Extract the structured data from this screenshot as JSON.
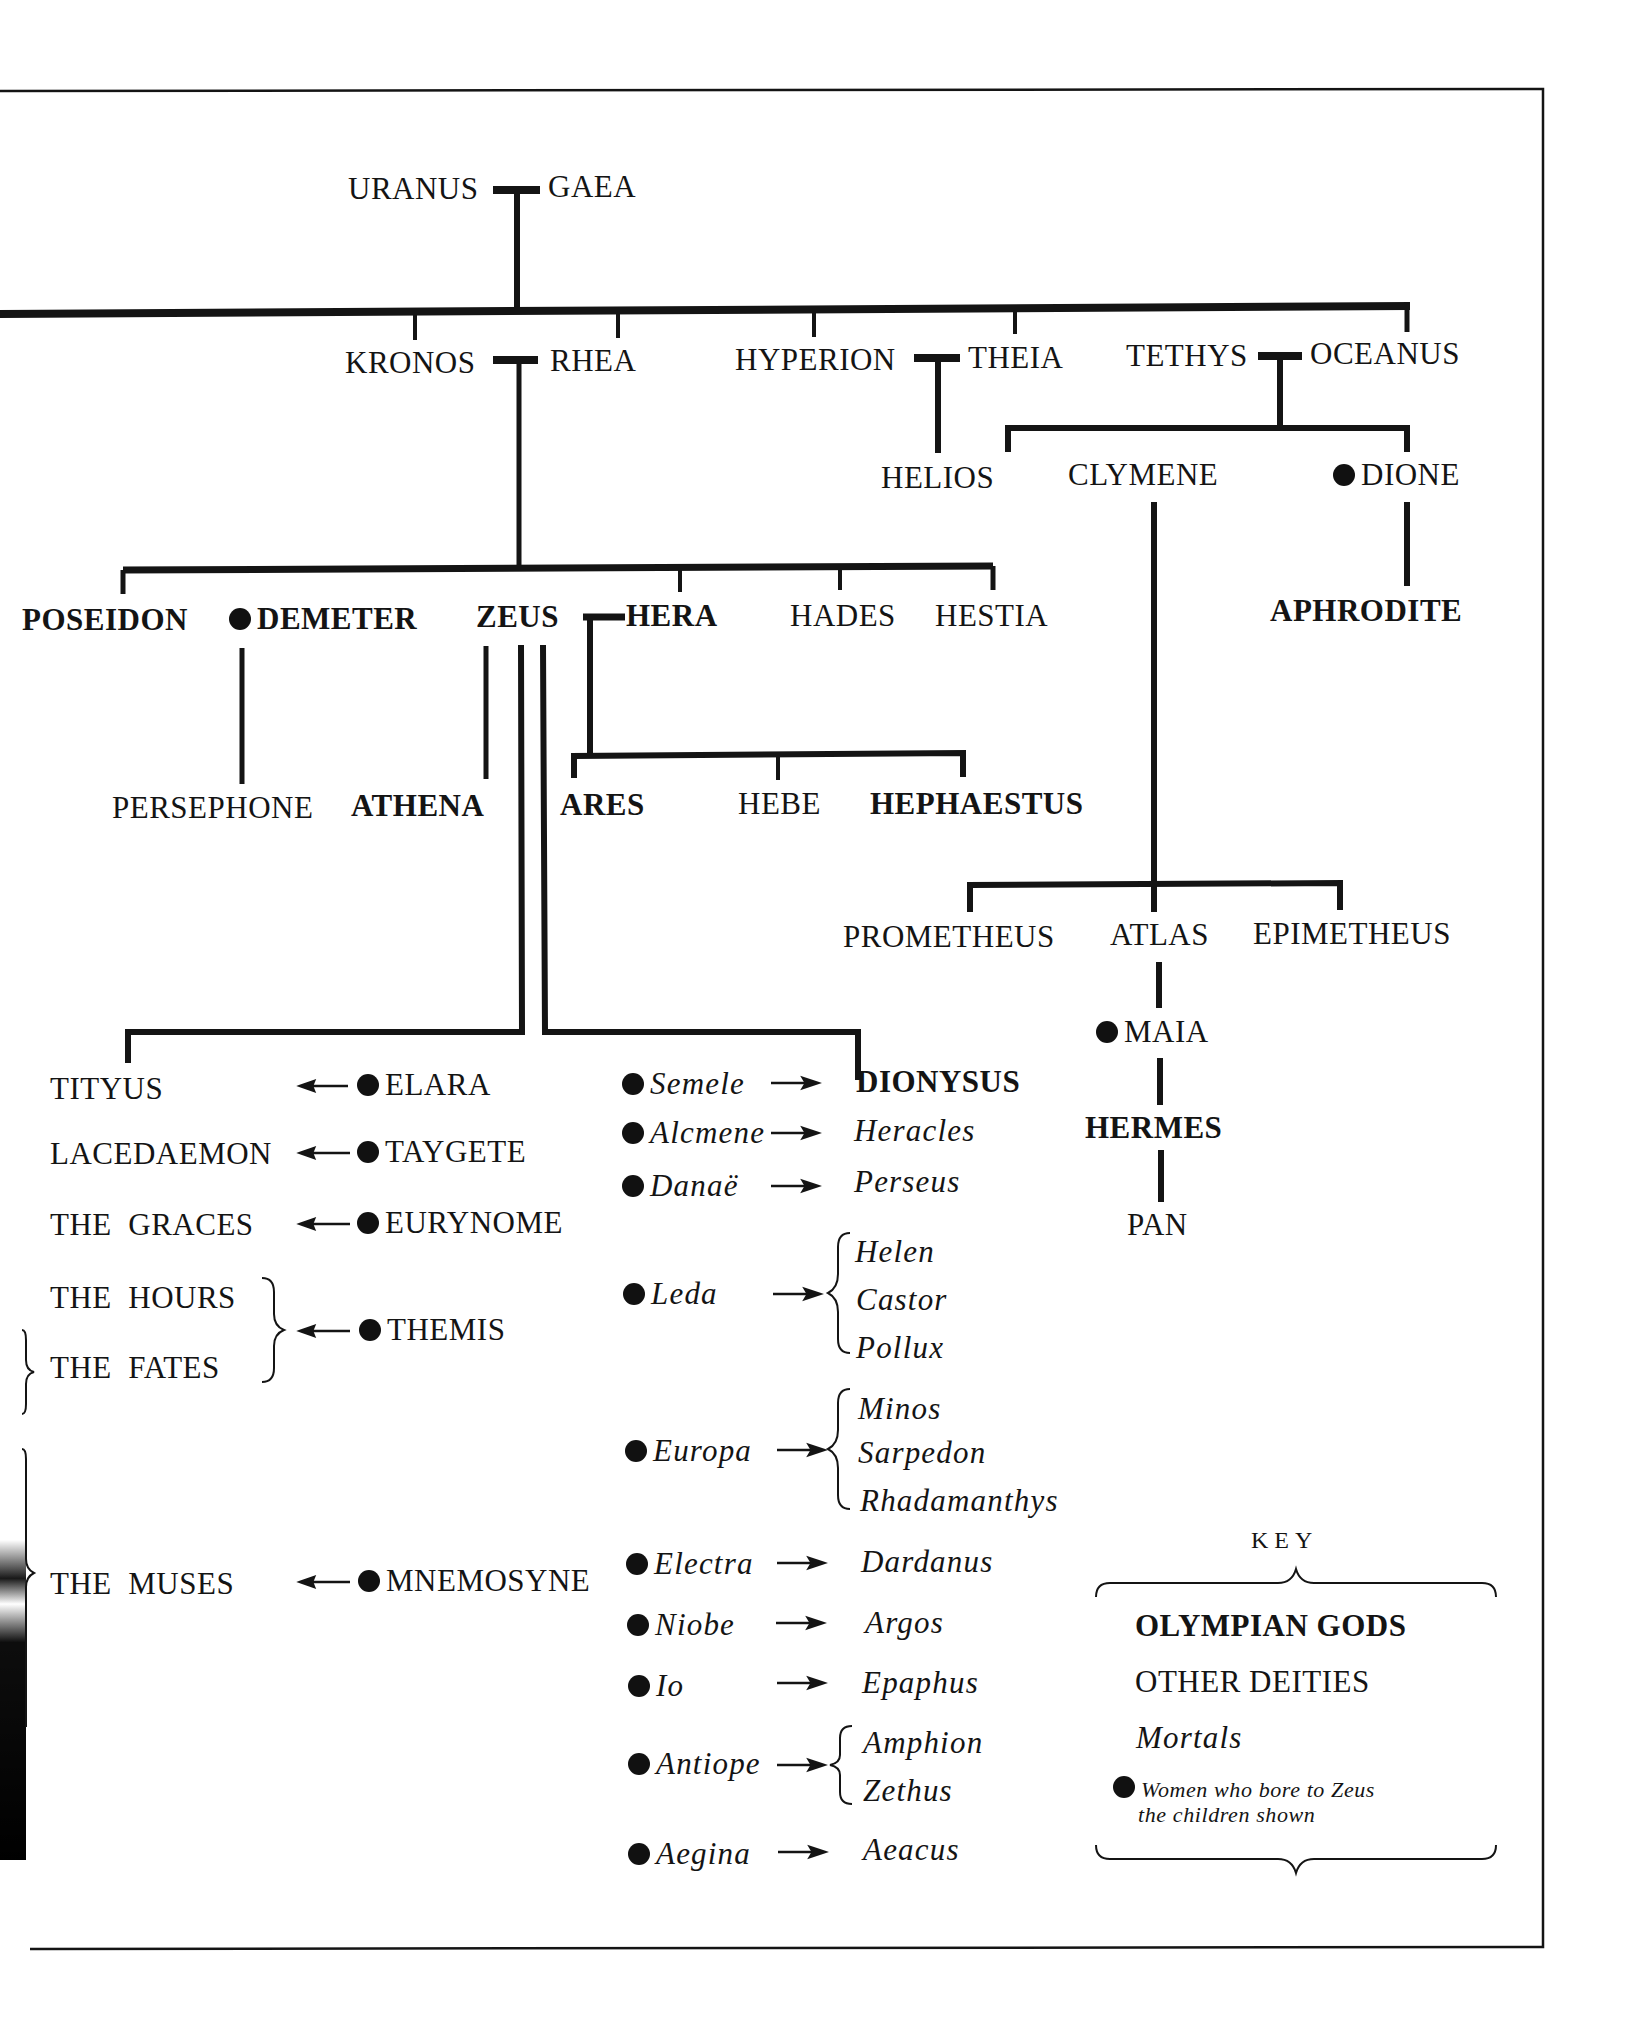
{
  "diagram": {
    "type": "family-tree",
    "generation_1": {
      "father": "URANUS",
      "mother": "GAEA"
    },
    "generation_2": {
      "kronos": "KRONOS",
      "rhea": "RHEA",
      "hyperion": "HYPERION",
      "theia": "THEIA",
      "tethys": "TETHYS",
      "oceanus": "OCEANUS"
    },
    "generation_3": {
      "helios": "HELIOS",
      "clymene": "CLYMENE",
      "dione": "DIONE",
      "aphrodite": "APHRODITE",
      "poseidon": "POSEIDON",
      "demeter": "DEMETER",
      "zeus": "ZEUS",
      "hera": "HERA",
      "hades": "HADES",
      "hestia": "HESTIA"
    },
    "generation_4": {
      "persephone": "PERSEPHONE",
      "athena": "ATHENA",
      "ares": "ARES",
      "hebe": "HEBE",
      "hephaestus": "HEPHAESTUS",
      "prometheus": "PROMETHEUS",
      "atlas": "ATLAS",
      "epimetheus": "EPIMETHEUS",
      "maia": "MAIA",
      "hermes": "HERMES",
      "pan": "PAN"
    },
    "zeus_offspring_deities": [
      {
        "child": "TITYUS",
        "mother": "ELARA"
      },
      {
        "child": "LACEDAEMON",
        "mother": "TAYGETE"
      },
      {
        "child": "THE  GRACES",
        "mother": "EURYNOME"
      },
      {
        "child": "THE  HOURS",
        "mother": "THEMIS"
      },
      {
        "child": "THE  FATES",
        "mother": "THEMIS"
      },
      {
        "child": "THE  MUSES",
        "mother": "MNEMOSYNE"
      }
    ],
    "zeus_offspring_mortal_mothers": [
      {
        "mother": "Semele",
        "children": [
          "DIONYSUS"
        ]
      },
      {
        "mother": "Alcmene",
        "children": [
          "Heracles"
        ]
      },
      {
        "mother": "Danaë",
        "children": [
          "Perseus"
        ]
      },
      {
        "mother": "Leda",
        "children": [
          "Helen",
          "Castor",
          "Pollux"
        ]
      },
      {
        "mother": "Europa",
        "children": [
          "Minos",
          "Sarpedon",
          "Rhadamanthys"
        ]
      },
      {
        "mother": "Electra",
        "children": [
          "Dardanus"
        ]
      },
      {
        "mother": "Niobe",
        "children": [
          "Argos"
        ]
      },
      {
        "mother": "Io",
        "children": [
          "Epaphus"
        ]
      },
      {
        "mother": "Antiope",
        "children": [
          "Amphion",
          "Zethus"
        ]
      },
      {
        "mother": "Aegina",
        "children": [
          "Aeacus"
        ]
      }
    ],
    "key": {
      "title": "KEY",
      "olympian": "OLYMPIAN GODS",
      "other": "OTHER DEITIES",
      "mortals": "Mortals",
      "women_line1": "Women who bore to Zeus",
      "women_line2": "the children shown"
    },
    "colors": {
      "ink": "#141414",
      "paper": "#ffffff"
    }
  }
}
